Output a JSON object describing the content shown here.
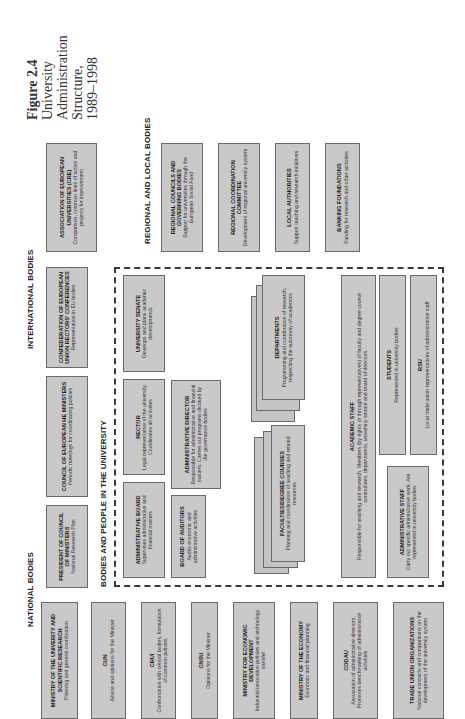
{
  "caption": {
    "figure": "Figure 2.4",
    "line1": "University",
    "line2": "Administration",
    "line3": "Structure,",
    "line4": "1989–1998"
  },
  "sections": {
    "international": "INTERNATIONAL BODIES",
    "regional": "REGIONAL AND LOCAL BODIES",
    "national": "NATIONAL BODIES",
    "university": "BODIES AND PEOPLE IN THE UNIVERSITY"
  },
  "international_bodies": [
    {
      "title": "ASSOCIATION OF EUROPEAN UNIVERSITIES (CRE)",
      "desc": "Comparison, common lines of action and projects for improvement"
    },
    {
      "title": "CONFEDERATION OF EUROPEAN UNION RECTORS' CONFERENCES",
      "desc": "Representation in EU bodies"
    },
    {
      "title": "COUNCIL OF EUROPEAN HE MINISTERS",
      "desc": "Periodic meetings for coordinating policies"
    },
    {
      "title": "PRESIDENT OF COUNCIL OF MINISTERS",
      "desc": "National Research Plan"
    }
  ],
  "regional_bodies": [
    {
      "title": "REGIONAL COUNCILS AND GOVERNING BODIES",
      "desc": "Support for universities through the European Social Fund"
    },
    {
      "title": "REGIONAL COORDINATION COMMITTEE",
      "desc": "Development of regional university system"
    },
    {
      "title": "LOCAL AUTHORITIES",
      "desc": "Support teaching and research initiatives"
    },
    {
      "title": "BANKING FOUNDATIONS",
      "desc": "Funding for research and other activities"
    }
  ],
  "national_bodies": [
    {
      "title": "MINISTRY OF THE UNIVERITY AND SCIENTIFIC RESEARCH",
      "desc": "Planning and general coordination"
    },
    {
      "title": "CUN",
      "desc": "Advice and opinions for the Minister"
    },
    {
      "title": "CRUI",
      "desc": "Confrontation with central bodies, formulation of common policies"
    },
    {
      "title": "CNSU",
      "desc": "Opinions for the Minister"
    },
    {
      "title": "MINISTRY FOR ECONOMIC DEVELOPMENT",
      "desc": "Industrial innovation policies and technology transfer"
    },
    {
      "title": "MINISTRY OF THE ECONOMY",
      "desc": "Economic and financial planning"
    },
    {
      "title": "CODAU",
      "desc": "Association of administrative directors. Promotes benchmarking of administrative activities"
    },
    {
      "title": "TRADE UNION ORGANIZATIONS",
      "desc": "National contracts and comparisons on the development of the university system"
    }
  ],
  "university_bodies": {
    "senate": {
      "title": "UNIVERSITY SENATE",
      "desc": "Develops and plans academic developments"
    },
    "rector": {
      "title": "RECTOR",
      "desc": "Legal representative of the university. Coordinates all activities"
    },
    "admin_director": {
      "title": "ADMINISTRATIVE DIRECTOR",
      "desc": "Responsible for administrative and financial matters. Carries out programs dictated by the governance bodies"
    },
    "admin_board": {
      "title": "ADMINISTRATIVE BOARD",
      "desc": "Supervises administrative and financial matters"
    },
    "auditors": {
      "title": "BOARD OF AUDITORS",
      "desc": "Audits economic and administrative activities"
    },
    "departments": {
      "title": "DEPARTMENTS",
      "desc": "Programming and coordination of research, respecting the autonomy of academics"
    },
    "faculties": {
      "title": "FACULTIES/DEGREE COURSES",
      "desc": "Planning and coordination of teaching and related resources"
    },
    "academic_staff": {
      "title": "ACADEMIC STAFF",
      "desc": "Responsible for teaching and research. Members (by rights or through representatives) of faculty and degree course committees, departments, university senate and board of directors"
    },
    "students": {
      "title": "STUDENTS",
      "desc": "Represented in university bodies"
    },
    "rsu": {
      "title": "RSU",
      "desc": "Local trade union representatives of administrative staff"
    },
    "admin_staff": {
      "title": "ADMINISTRATIVE STAFF",
      "desc": "Carry out specific administrative work. Are represented in university bodies"
    }
  },
  "colors": {
    "box_fill": "#c9c9c9",
    "box_border": "#6a6a6a",
    "dashed_border": "#3a3a3a",
    "background": "#ffffff"
  }
}
